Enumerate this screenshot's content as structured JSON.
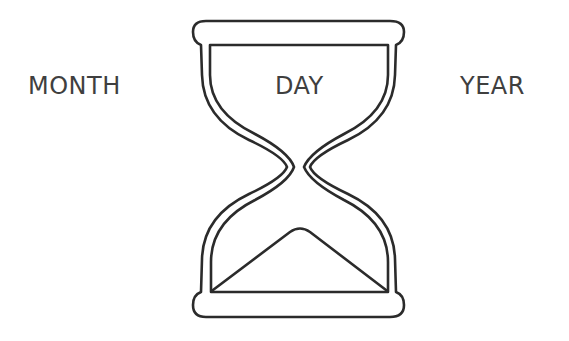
{
  "labels": {
    "left": "MONTH",
    "center": "DAY",
    "right": "YEAR"
  },
  "icon": {
    "name": "hourglass-icon",
    "stroke_color": "#2b2b2b",
    "fill_color": "#ffffff"
  },
  "colors": {
    "background": "#ffffff",
    "text": "#3f3f3f"
  }
}
